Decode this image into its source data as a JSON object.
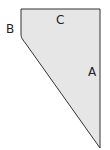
{
  "diagram": {
    "shape": {
      "type": "polygon",
      "points": [
        [
          21,
          9
        ],
        [
          100,
          9
        ],
        [
          100,
          148
        ],
        [
          23,
          40
        ],
        [
          21,
          37
        ]
      ],
      "fill": "#e6e6e6",
      "stroke": "#333333"
    },
    "labels": {
      "a": "A",
      "b": "B",
      "c": "C"
    },
    "top_caption_clipped": "—"
  }
}
